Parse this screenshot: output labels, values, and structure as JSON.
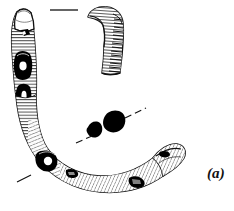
{
  "figure": {
    "label": "(a)",
    "background_color": "#ffffff",
    "ink_color": "#111111",
    "inlay_color": "#000000",
    "hatch_color": "#1a1a1a",
    "width": 234,
    "height": 211
  },
  "objects": {
    "main_artifact": {
      "name": "c-shaped-hatched-artifact",
      "description": "Large C-shaped curved object, hatched with fine transverse lines, with dark inlay patches",
      "terminals": [
        "upper-left-rounded-cap",
        "lower-right-rounded-knob"
      ]
    },
    "hook_fragment": {
      "name": "hook-shaped-fragment",
      "description": "Separate hooked fragment at upper right, hatched shaft descending from a curved head"
    },
    "black_fragments": [
      {
        "name": "black-fragment-small",
        "description": "Small solid black quadrilateral"
      },
      {
        "name": "black-fragment-large",
        "description": "Larger solid black quadrilateral"
      }
    ],
    "inlays": [
      {
        "name": "inlay-upper-left",
        "description": "Dark inlay patch near upper-left limb"
      },
      {
        "name": "inlay-mid-left",
        "description": "Dark elongated inlay with white eye-spot on left limb"
      },
      {
        "name": "inlay-lower-left",
        "description": "Dark inlay with white circular hole on lower curve"
      },
      {
        "name": "inlay-lower-centre",
        "description": "Small dark patch on lower curve"
      },
      {
        "name": "inlay-lower-right",
        "description": "Dark inlay patch near right terminal"
      }
    ],
    "leader_lines": [
      {
        "name": "leader-line-top",
        "description": "Horizontal leader line above the artifact"
      },
      {
        "name": "leader-line-upper-right",
        "description": "Diagonal dashed leader line to upper right"
      },
      {
        "name": "leader-line-lower-left",
        "description": "Short diagonal leader tick at lower left of centre"
      },
      {
        "name": "leader-line-bottom-left",
        "description": "Short diagonal leader tick at bottom left"
      }
    ]
  }
}
